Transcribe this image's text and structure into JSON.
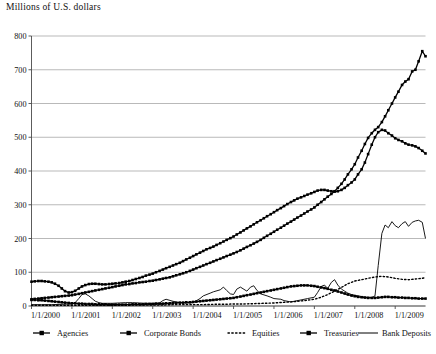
{
  "chart_data": {
    "type": "line",
    "title": "Millions of U.S. dollars",
    "xlabel": "",
    "ylabel": "Millions of U.S. dollars",
    "ylim": [
      0,
      800
    ],
    "yticks": [
      0,
      100,
      200,
      300,
      400,
      500,
      600,
      700,
      800
    ],
    "grid": true,
    "legend_position": "bottom",
    "xtick_labels": [
      "1/1/2000",
      "1/1/2001",
      "1/1/2002",
      "1/1/2003",
      "1/1/2004",
      "1/1/2005",
      "1/1/2006",
      "1/1/2007",
      "1/1/2008",
      "1/1/2009"
    ],
    "x_start": 2000.0,
    "x_end": 2009.75,
    "series": [
      {
        "name": "Agencies",
        "style": "line-marker",
        "color": "#000000",
        "x": [
          2000.0,
          2000.08,
          2000.17,
          2000.25,
          2000.33,
          2000.42,
          2000.5,
          2000.58,
          2000.67,
          2000.75,
          2000.83,
          2000.92,
          2001.0,
          2001.08,
          2001.17,
          2001.25,
          2001.33,
          2001.42,
          2001.5,
          2001.58,
          2001.67,
          2001.75,
          2001.83,
          2001.92,
          2002.0,
          2002.08,
          2002.17,
          2002.25,
          2002.33,
          2002.42,
          2002.5,
          2002.58,
          2002.67,
          2002.75,
          2002.83,
          2002.92,
          2003.0,
          2003.08,
          2003.17,
          2003.25,
          2003.33,
          2003.42,
          2003.5,
          2003.58,
          2003.67,
          2003.75,
          2003.83,
          2003.92,
          2004.0,
          2004.08,
          2004.17,
          2004.25,
          2004.33,
          2004.42,
          2004.5,
          2004.58,
          2004.67,
          2004.75,
          2004.83,
          2004.92,
          2005.0,
          2005.08,
          2005.17,
          2005.25,
          2005.33,
          2005.42,
          2005.5,
          2005.58,
          2005.67,
          2005.75,
          2005.83,
          2005.92,
          2006.0,
          2006.08,
          2006.17,
          2006.25,
          2006.33,
          2006.42,
          2006.5,
          2006.58,
          2006.67,
          2006.75,
          2006.83,
          2006.92,
          2007.0,
          2007.08,
          2007.17,
          2007.25,
          2007.33,
          2007.42,
          2007.5,
          2007.58,
          2007.67,
          2007.75,
          2007.83,
          2007.92,
          2008.0,
          2008.08,
          2008.17,
          2008.25,
          2008.33,
          2008.42,
          2008.5,
          2008.58,
          2008.67,
          2008.75,
          2008.83,
          2008.92,
          2009.0,
          2009.08,
          2009.17,
          2009.25,
          2009.33,
          2009.42,
          2009.5,
          2009.58,
          2009.67,
          2009.75
        ],
        "y": [
          72,
          73,
          74,
          74,
          73,
          72,
          70,
          66,
          60,
          52,
          44,
          40,
          41,
          45,
          52,
          58,
          62,
          65,
          66,
          66,
          65,
          64,
          64,
          65,
          66,
          67,
          68,
          70,
          72,
          74,
          77,
          80,
          83,
          86,
          90,
          93,
          96,
          100,
          104,
          108,
          112,
          116,
          120,
          124,
          128,
          133,
          138,
          143,
          148,
          153,
          158,
          163,
          168,
          172,
          176,
          181,
          186,
          191,
          196,
          201,
          206,
          212,
          218,
          224,
          230,
          236,
          242,
          248,
          254,
          260,
          266,
          272,
          278,
          284,
          290,
          296,
          302,
          308,
          313,
          318,
          322,
          326,
          330,
          334,
          338,
          342,
          344,
          344,
          342,
          340,
          339,
          340,
          344,
          350,
          358,
          366,
          375,
          390,
          405,
          425,
          450,
          478,
          500,
          515,
          522,
          520,
          512,
          505,
          497,
          492,
          488,
          482,
          478,
          476,
          473,
          468,
          460,
          452
        ]
      },
      {
        "name": "Corporate Bonds",
        "style": "line-marker",
        "color": "#000000",
        "x": [
          2000.0,
          2000.08,
          2000.17,
          2000.25,
          2000.33,
          2000.42,
          2000.5,
          2000.58,
          2000.67,
          2000.75,
          2000.83,
          2000.92,
          2001.0,
          2001.08,
          2001.17,
          2001.25,
          2001.33,
          2001.42,
          2001.5,
          2001.58,
          2001.67,
          2001.75,
          2001.83,
          2001.92,
          2002.0,
          2002.08,
          2002.17,
          2002.25,
          2002.33,
          2002.42,
          2002.5,
          2002.58,
          2002.67,
          2002.75,
          2002.83,
          2002.92,
          2003.0,
          2003.08,
          2003.17,
          2003.25,
          2003.33,
          2003.42,
          2003.5,
          2003.58,
          2003.67,
          2003.75,
          2003.83,
          2003.92,
          2004.0,
          2004.08,
          2004.17,
          2004.25,
          2004.33,
          2004.42,
          2004.5,
          2004.58,
          2004.67,
          2004.75,
          2004.83,
          2004.92,
          2005.0,
          2005.08,
          2005.17,
          2005.25,
          2005.33,
          2005.42,
          2005.5,
          2005.58,
          2005.67,
          2005.75,
          2005.83,
          2005.92,
          2006.0,
          2006.08,
          2006.17,
          2006.25,
          2006.33,
          2006.42,
          2006.5,
          2006.58,
          2006.67,
          2006.75,
          2006.83,
          2006.92,
          2007.0,
          2007.08,
          2007.17,
          2007.25,
          2007.33,
          2007.42,
          2007.5,
          2007.58,
          2007.67,
          2007.75,
          2007.83,
          2007.92,
          2008.0,
          2008.08,
          2008.17,
          2008.25,
          2008.33,
          2008.42,
          2008.5,
          2008.58,
          2008.67,
          2008.75,
          2008.83,
          2008.92,
          2009.0,
          2009.08,
          2009.17,
          2009.25,
          2009.33,
          2009.42,
          2009.5,
          2009.58,
          2009.67,
          2009.75
        ],
        "y": [
          20,
          21,
          22,
          23,
          24,
          25,
          26,
          27,
          28,
          29,
          30,
          31,
          32,
          34,
          36,
          38,
          40,
          42,
          44,
          46,
          48,
          50,
          52,
          54,
          56,
          58,
          60,
          62,
          64,
          65,
          67,
          68,
          70,
          71,
          72,
          74,
          75,
          77,
          79,
          81,
          83,
          85,
          88,
          91,
          94,
          97,
          100,
          104,
          108,
          112,
          116,
          120,
          124,
          128,
          132,
          136,
          140,
          144,
          148,
          152,
          156,
          160,
          165,
          170,
          175,
          180,
          185,
          190,
          196,
          202,
          208,
          214,
          220,
          226,
          232,
          238,
          244,
          250,
          256,
          262,
          268,
          274,
          280,
          286,
          292,
          300,
          308,
          316,
          324,
          332,
          340,
          350,
          362,
          375,
          390,
          405,
          420,
          440,
          460,
          480,
          498,
          512,
          522,
          530,
          545,
          562,
          580,
          600,
          618,
          635,
          655,
          665,
          672,
          695,
          700,
          725,
          755,
          740
        ]
      },
      {
        "name": "Equities",
        "style": "dotted",
        "color": "#000000",
        "x": [
          2000.0,
          2000.25,
          2000.5,
          2000.75,
          2001.0,
          2001.25,
          2001.5,
          2001.75,
          2002.0,
          2002.25,
          2002.5,
          2002.75,
          2003.0,
          2003.25,
          2003.5,
          2003.75,
          2004.0,
          2004.25,
          2004.5,
          2004.75,
          2005.0,
          2005.25,
          2005.5,
          2005.75,
          2006.0,
          2006.25,
          2006.5,
          2006.75,
          2007.0,
          2007.17,
          2007.33,
          2007.5,
          2007.67,
          2007.83,
          2008.0,
          2008.17,
          2008.33,
          2008.5,
          2008.67,
          2008.83,
          2009.0,
          2009.17,
          2009.33,
          2009.5,
          2009.67,
          2009.75
        ],
        "y": [
          2,
          2,
          2,
          2,
          2,
          2,
          2,
          2,
          2,
          3,
          3,
          3,
          3,
          3,
          4,
          4,
          4,
          4,
          5,
          5,
          6,
          6,
          7,
          8,
          9,
          11,
          13,
          16,
          20,
          26,
          34,
          44,
          55,
          66,
          74,
          78,
          82,
          86,
          88,
          86,
          82,
          79,
          78,
          80,
          82,
          84
        ]
      },
      {
        "name": "Treasuries",
        "style": "line-marker",
        "color": "#000000",
        "x": [
          2000.0,
          2000.08,
          2000.17,
          2000.25,
          2000.33,
          2000.42,
          2000.5,
          2000.58,
          2000.67,
          2000.75,
          2000.83,
          2000.92,
          2001.0,
          2001.08,
          2001.17,
          2001.25,
          2001.33,
          2001.42,
          2001.5,
          2001.58,
          2001.67,
          2001.75,
          2001.83,
          2001.92,
          2002.0,
          2002.08,
          2002.17,
          2002.25,
          2002.33,
          2002.42,
          2002.5,
          2002.58,
          2002.67,
          2002.75,
          2002.83,
          2002.92,
          2003.0,
          2003.08,
          2003.17,
          2003.25,
          2003.33,
          2003.42,
          2003.5,
          2003.58,
          2003.67,
          2003.75,
          2003.83,
          2003.92,
          2004.0,
          2004.08,
          2004.17,
          2004.25,
          2004.33,
          2004.42,
          2004.5,
          2004.58,
          2004.67,
          2004.75,
          2004.83,
          2004.92,
          2005.0,
          2005.08,
          2005.17,
          2005.25,
          2005.33,
          2005.42,
          2005.5,
          2005.58,
          2005.67,
          2005.75,
          2005.83,
          2005.92,
          2006.0,
          2006.08,
          2006.17,
          2006.25,
          2006.33,
          2006.42,
          2006.5,
          2006.58,
          2006.67,
          2006.75,
          2006.83,
          2006.92,
          2007.0,
          2007.08,
          2007.17,
          2007.25,
          2007.33,
          2007.42,
          2007.5,
          2007.58,
          2007.67,
          2007.75,
          2007.83,
          2007.92,
          2008.0,
          2008.08,
          2008.17,
          2008.25,
          2008.33,
          2008.42,
          2008.5,
          2008.58,
          2008.67,
          2008.75,
          2008.83,
          2008.92,
          2009.0,
          2009.08,
          2009.17,
          2009.25,
          2009.33,
          2009.42,
          2009.5,
          2009.58,
          2009.67,
          2009.75
        ],
        "y": [
          18,
          18,
          17,
          17,
          16,
          15,
          14,
          13,
          12,
          11,
          10,
          9,
          8,
          8,
          7,
          7,
          6,
          6,
          6,
          5,
          5,
          5,
          5,
          4,
          4,
          4,
          4,
          4,
          4,
          4,
          5,
          5,
          5,
          5,
          6,
          6,
          6,
          7,
          7,
          7,
          8,
          8,
          9,
          9,
          10,
          10,
          11,
          11,
          12,
          13,
          14,
          15,
          16,
          17,
          18,
          19,
          20,
          21,
          22,
          23,
          24,
          26,
          28,
          30,
          32,
          34,
          36,
          38,
          40,
          42,
          44,
          46,
          48,
          50,
          52,
          54,
          56,
          58,
          59,
          60,
          61,
          61,
          61,
          60,
          59,
          57,
          55,
          53,
          51,
          48,
          46,
          43,
          40,
          37,
          34,
          31,
          29,
          27,
          26,
          25,
          24,
          24,
          24,
          25,
          26,
          27,
          27,
          26,
          26,
          25,
          25,
          24,
          24,
          23,
          23,
          22,
          22,
          22
        ]
      },
      {
        "name": "Bank Deposits",
        "style": "plain",
        "color": "#000000",
        "x": [
          2000.0,
          2000.25,
          2000.5,
          2000.75,
          2001.0,
          2001.08,
          2001.17,
          2001.25,
          2001.33,
          2001.42,
          2001.5,
          2001.58,
          2001.67,
          2001.75,
          2001.83,
          2001.92,
          2002.0,
          2002.17,
          2002.33,
          2002.5,
          2002.67,
          2002.83,
          2003.0,
          2003.17,
          2003.25,
          2003.33,
          2003.5,
          2003.67,
          2003.83,
          2004.0,
          2004.17,
          2004.25,
          2004.42,
          2004.5,
          2004.67,
          2004.75,
          2004.83,
          2004.92,
          2005.0,
          2005.08,
          2005.17,
          2005.33,
          2005.42,
          2005.5,
          2005.58,
          2005.67,
          2005.83,
          2005.92,
          2006.0,
          2006.17,
          2006.25,
          2006.42,
          2006.5,
          2006.67,
          2006.83,
          2007.0,
          2007.08,
          2007.17,
          2007.25,
          2007.33,
          2007.42,
          2007.5,
          2007.58,
          2007.67,
          2007.75,
          2007.83,
          2007.92,
          2008.0,
          2008.08,
          2008.17,
          2008.25,
          2008.33,
          2008.42,
          2008.5,
          2008.58,
          2008.67,
          2008.75,
          2008.83,
          2008.92,
          2009.0,
          2009.08,
          2009.17,
          2009.25,
          2009.33,
          2009.42,
          2009.5,
          2009.58,
          2009.67,
          2009.75
        ],
        "y": [
          4,
          4,
          4,
          5,
          6,
          10,
          22,
          34,
          36,
          30,
          22,
          14,
          10,
          8,
          8,
          8,
          8,
          9,
          10,
          10,
          9,
          8,
          8,
          9,
          16,
          20,
          14,
          10,
          9,
          10,
          22,
          30,
          38,
          42,
          48,
          56,
          46,
          36,
          34,
          50,
          56,
          44,
          56,
          60,
          46,
          36,
          30,
          26,
          22,
          20,
          16,
          12,
          14,
          18,
          22,
          26,
          40,
          58,
          62,
          52,
          70,
          78,
          62,
          50,
          44,
          38,
          34,
          32,
          30,
          28,
          26,
          26,
          25,
          30,
          120,
          215,
          240,
          232,
          250,
          238,
          232,
          244,
          250,
          236,
          248,
          252,
          254,
          248,
          200
        ]
      }
    ]
  },
  "legend": {
    "items": [
      {
        "label": "Agencies",
        "style": "line-marker"
      },
      {
        "label": "Corporate Bonds",
        "style": "line-marker"
      },
      {
        "label": "Equities",
        "style": "dotted"
      },
      {
        "label": "Treasuries",
        "style": "line-marker"
      },
      {
        "label": "Bank Deposits",
        "style": "plain"
      }
    ]
  }
}
